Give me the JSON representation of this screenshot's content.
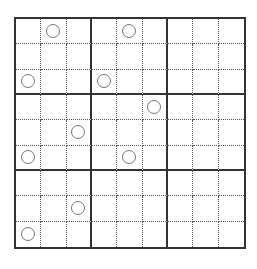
{
  "puzzle": {
    "rows": 9,
    "cols": 9,
    "box_size": 3,
    "circles": [
      {
        "row": 0,
        "col": 1
      },
      {
        "row": 0,
        "col": 4
      },
      {
        "row": 2,
        "col": 0
      },
      {
        "row": 2,
        "col": 3
      },
      {
        "row": 3,
        "col": 5
      },
      {
        "row": 4,
        "col": 2
      },
      {
        "row": 5,
        "col": 0
      },
      {
        "row": 5,
        "col": 4
      },
      {
        "row": 7,
        "col": 2
      },
      {
        "row": 8,
        "col": 0
      }
    ],
    "colors": {
      "thick_line": "#333333",
      "dotted_line": "#555555",
      "circle_stroke": "#777777",
      "background": "#ffffff"
    }
  }
}
